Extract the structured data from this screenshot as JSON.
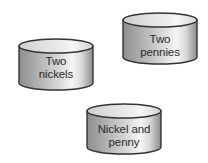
{
  "diagram": {
    "colors": {
      "outline": "#333333",
      "top_face": "#dedede",
      "top_highlight": "#f4f4f4",
      "body_dark": "#8e8e8e",
      "body_mid": "#c4c4c4",
      "body_light": "#f2f2f2",
      "text": "#2a2a2a"
    },
    "containers": [
      {
        "id": "two-nickels",
        "label_line1": "Two",
        "label_line2": "nickels",
        "x": 18,
        "y": 38,
        "width": 76,
        "height": 53
      },
      {
        "id": "two-pennies",
        "label_line1": "Two",
        "label_line2": "pennies",
        "x": 122,
        "y": 12,
        "width": 76,
        "height": 53
      },
      {
        "id": "nickel-and-penny",
        "label_line1": "Nickel and",
        "label_line2": "penny",
        "x": 86,
        "y": 103,
        "width": 76,
        "height": 52
      }
    ]
  }
}
